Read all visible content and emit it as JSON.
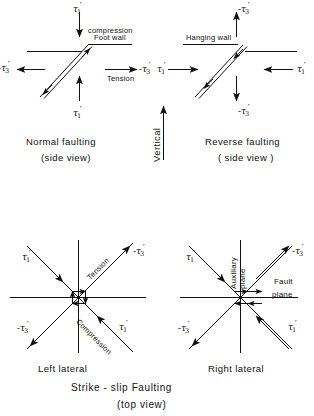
{
  "figure": {
    "title_main": "Strike - slip Faulting",
    "title_sub": "(top view)"
  },
  "symbols": {
    "tau1": {
      "neg": "",
      "tau": "τ",
      "sub": "1",
      "prime": "′"
    },
    "tau1_neg": {
      "neg": "-",
      "tau": "τ",
      "sub": "1",
      "prime": "′"
    },
    "tau3": {
      "neg": "",
      "tau": "τ",
      "sub": "3",
      "prime": "′"
    },
    "tau3_neg": {
      "neg": "-",
      "tau": "τ",
      "sub": "3",
      "prime": "′"
    }
  },
  "panels": {
    "normal_faulting": {
      "name": "Normal faulting",
      "view": "(side view)",
      "wall_label": "Foot wall",
      "top_arrow_label": "compression",
      "right_arrow_label": "Tension",
      "stress_top": "τ₁′",
      "stress_bottom": "τ₁′",
      "stress_left": "-τ₃′",
      "stress_right": "-τ₃′"
    },
    "reverse_faulting": {
      "name": "Reverse faulting",
      "view": "( side view )",
      "wall_label": "Hanging wall",
      "stress_top": "-τ₃′",
      "stress_bottom": "-τ₃′",
      "stress_left": "τ₁′",
      "stress_right": "τ₁′"
    },
    "vertical_axis": {
      "label": "Vertical"
    },
    "left_lateral": {
      "name": "Left lateral",
      "tension_label": "Tension",
      "compression_label": "Compression",
      "stress_upper_left": "τ₁′",
      "stress_upper_right": "-τ₃′",
      "stress_lower_left": "-τ₃′",
      "stress_lower_right": "τ₁′"
    },
    "right_lateral": {
      "name": "Right lateral",
      "auxiliary_plane_label_1": "Auxiliary",
      "auxiliary_plane_label_2": "plane",
      "fault_plane_label_1": "Fault",
      "fault_plane_label_2": "plane",
      "stress_upper_left": "τ₁′",
      "stress_upper_right": "-τ₃′",
      "stress_lower_left": "-τ₃′",
      "stress_lower_right": "τ₁′"
    }
  },
  "colors": {
    "ink": "#111111",
    "background": "#ffffff"
  }
}
